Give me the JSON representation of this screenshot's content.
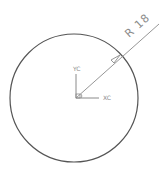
{
  "drawing": {
    "circle": {
      "cx": 74,
      "cy": 98,
      "r": 64,
      "stroke": "#555555"
    },
    "dimension": {
      "label": "R 18",
      "color": "#8a8a8a"
    },
    "axes": {
      "x_label": "XC",
      "y_label": "YC",
      "color": "#8a8a8a"
    }
  }
}
